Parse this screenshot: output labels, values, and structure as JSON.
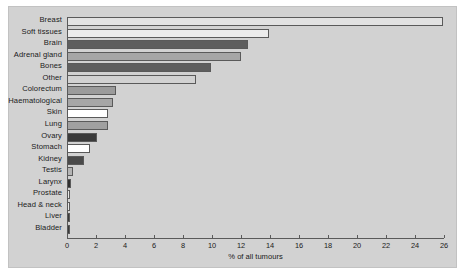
{
  "chart_data": {
    "type": "bar",
    "orientation": "horizontal",
    "title": "",
    "xlabel": "% of all tumours",
    "ylabel": "",
    "xlim": [
      0,
      26
    ],
    "xticks": [
      0,
      2,
      4,
      6,
      8,
      10,
      12,
      14,
      16,
      18,
      20,
      22,
      24,
      26
    ],
    "grid": false,
    "legend": null,
    "categories": [
      "Breast",
      "Soft tissues",
      "Brain",
      "Adrenal  gland",
      "Bones",
      "Other",
      "Colorectum",
      "Haematological",
      "Skin",
      "Lung",
      "Ovary",
      "Stomach",
      "Kidney",
      "Testis",
      "Larynx",
      "Prostate",
      "Head & neck",
      "Liver",
      "Bladder"
    ],
    "values": [
      25.9,
      13.9,
      12.5,
      12.0,
      9.9,
      8.9,
      3.4,
      3.2,
      2.8,
      2.8,
      2.1,
      1.6,
      1.2,
      0.4,
      0.3,
      0.2,
      0.2,
      0.2,
      0.2
    ],
    "bar_colors": [
      "#e2e2e2",
      "#ececec",
      "#5e5e5e",
      "#a6a6a6",
      "#5e5e5e",
      "#d2d2d2",
      "#9b9b9b",
      "#a6a6a6",
      "#ffffff",
      "#a0a0a0",
      "#3a3a3a",
      "#ffffff",
      "#4a4a4a",
      "#b5b5b5",
      "#2e2e2e",
      "#e8e8e8",
      "#e8e8e8",
      "#3a3a3a",
      "#3a3a3a"
    ]
  },
  "figure": {
    "background": "#d2d2d2",
    "axis_color": "#5a5a5a",
    "bar_edge_color": "#5a5a5a"
  }
}
